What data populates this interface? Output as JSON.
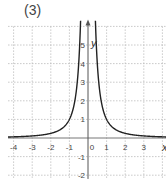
{
  "figure_label": "(3)",
  "chart_data": {
    "type": "line",
    "title": "",
    "function": "y = 1/x^2",
    "xlabel": "x",
    "ylabel": "y",
    "xlim": [
      -4.3,
      4.3
    ],
    "ylim": [
      -2.2,
      6
    ],
    "grid": true,
    "x_ticks": [
      -4,
      -3,
      -2,
      -1,
      0,
      1,
      2,
      3
    ],
    "y_ticks": [
      -2,
      -1,
      1,
      2,
      3,
      4,
      5
    ],
    "x_tick_labels": [
      "-4",
      "-3",
      "-2",
      "-1",
      "0",
      "1",
      "2",
      "3"
    ],
    "y_tick_labels": [
      "-2",
      "-1",
      "1",
      "2",
      "3",
      "4",
      "5"
    ],
    "series": [
      {
        "name": "y = 1/x^2",
        "x": [
          -4.3,
          -4,
          -3,
          -2,
          -1.5,
          -1,
          -0.8,
          -0.6,
          -0.5,
          -0.45,
          0.45,
          0.5,
          0.6,
          0.8,
          1,
          1.5,
          2,
          3,
          4,
          4.3
        ],
        "y": [
          0.054,
          0.0625,
          0.111,
          0.25,
          0.444,
          1,
          1.5625,
          2.778,
          4,
          4.94,
          4.94,
          4,
          2.778,
          1.5625,
          1,
          0.444,
          0.25,
          0.111,
          0.0625,
          0.054
        ]
      }
    ]
  },
  "axes": {
    "origin_px": [
      88,
      138
    ],
    "unit_px": 18.6
  }
}
